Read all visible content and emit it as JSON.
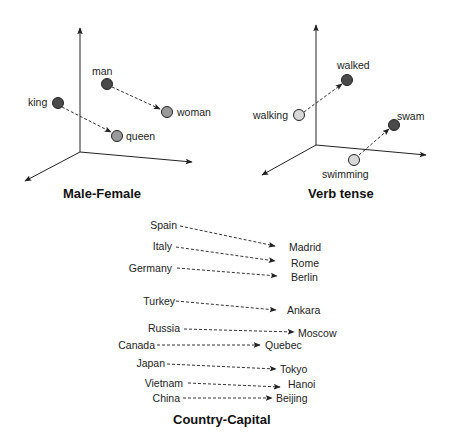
{
  "panels": {
    "male_female": {
      "title": "Male-Female",
      "points": [
        {
          "label": "man",
          "tone": "dark"
        },
        {
          "label": "woman",
          "tone": "light"
        },
        {
          "label": "king",
          "tone": "dark"
        },
        {
          "label": "queen",
          "tone": "light"
        }
      ],
      "arrows": [
        {
          "from": "man",
          "to": "woman"
        },
        {
          "from": "king",
          "to": "queen"
        }
      ]
    },
    "verb_tense": {
      "title": "Verb tense",
      "points": [
        {
          "label": "walking",
          "tone": "pale"
        },
        {
          "label": "walked",
          "tone": "dark"
        },
        {
          "label": "swimming",
          "tone": "pale"
        },
        {
          "label": "swam",
          "tone": "dark"
        }
      ],
      "arrows": [
        {
          "from": "walking",
          "to": "walked"
        },
        {
          "from": "swimming",
          "to": "swam"
        }
      ]
    },
    "country_capital": {
      "title": "Country-Capital",
      "pairs": [
        {
          "country": "Spain",
          "capital": "Madrid"
        },
        {
          "country": "Italy",
          "capital": "Rome"
        },
        {
          "country": "Germany",
          "capital": "Berlin"
        },
        {
          "country": "Turkey",
          "capital": "Ankara"
        },
        {
          "country": "Russia",
          "capital": "Moscow"
        },
        {
          "country": "Canada",
          "capital": "Quebec"
        },
        {
          "country": "Japan",
          "capital": "Tokyo"
        },
        {
          "country": "Vietnam",
          "capital": "Hanoi"
        },
        {
          "country": "China",
          "capital": "Beijing"
        }
      ]
    }
  },
  "colors": {
    "dark": "#4a4a4a",
    "light": "#9a9a9a",
    "pale": "#d8d8d8",
    "stroke": "#222222"
  }
}
